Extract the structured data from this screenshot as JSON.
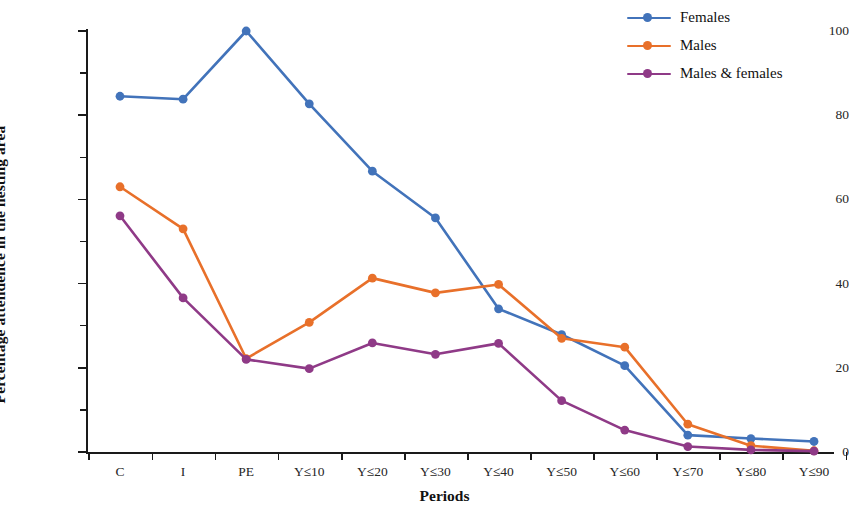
{
  "chart_data": {
    "type": "line",
    "title": "",
    "xlabel": "Periods",
    "ylabel": "Percentage attendence in the nesting area",
    "categories": [
      "C",
      "I",
      "PE",
      "Y≤10",
      "Y≤20",
      "Y≤30",
      "Y≤40",
      "Y≤50",
      "Y≤60",
      "Y≤70",
      "Y≤80",
      "Y≤90"
    ],
    "series": [
      {
        "name": "Females",
        "color": "#4273ba",
        "values": [
          84.5,
          83.8,
          100,
          82.7,
          66.7,
          55.6,
          34.0,
          27.9,
          20.5,
          4.0,
          3.2,
          2.5
        ]
      },
      {
        "name": "Males",
        "color": "#e8702a",
        "values": [
          63.0,
          53.0,
          22.2,
          30.8,
          41.3,
          37.8,
          39.8,
          27.0,
          24.9,
          6.6,
          1.5,
          0.3
        ]
      },
      {
        "name": "Males & females",
        "color": "#8f3a87",
        "values": [
          56.1,
          36.6,
          22.0,
          19.8,
          25.9,
          23.2,
          25.8,
          12.2,
          5.2,
          1.3,
          0.5,
          0.2
        ]
      }
    ],
    "ylim": [
      0,
      100
    ],
    "y_ticks_major": [
      0,
      20,
      40,
      60,
      80,
      100
    ],
    "y_ticks_minor": [
      10,
      30,
      50,
      70,
      90
    ],
    "grid": false,
    "legend_position": "top-right",
    "marker": "circle"
  },
  "axes": {
    "y_title": "Percentage attendence in the nesting area",
    "x_title": "Periods",
    "y_tick_labels": [
      "0",
      "20",
      "40",
      "60",
      "80",
      "100"
    ]
  },
  "legend": {
    "items": [
      {
        "label": "Females",
        "color": "#4273ba"
      },
      {
        "label": "Males",
        "color": "#e8702a"
      },
      {
        "label": "Males & females",
        "color": "#8f3a87"
      }
    ]
  }
}
